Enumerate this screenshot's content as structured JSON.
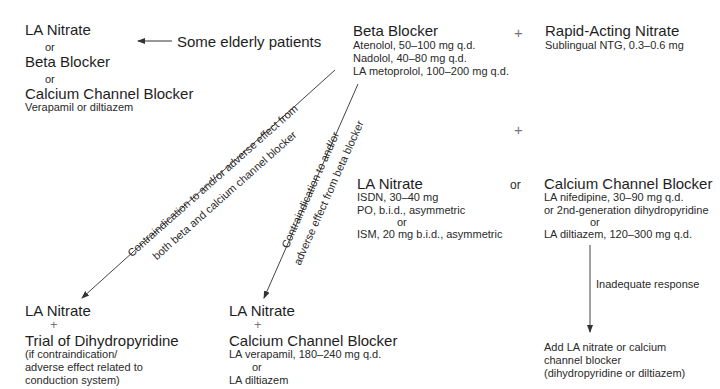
{
  "top_left": {
    "option1": "LA Nitrate",
    "or1": "or",
    "option2": "Beta Blocker",
    "or2": "or",
    "option3": "Calcium Channel Blocker",
    "option3_detail": "Verapamil or diltiazem"
  },
  "elderly_label": "Some elderly patients",
  "beta_blocker": {
    "title": "Beta Blocker",
    "doses": [
      "Atenolol, 50–100 mg q.d.",
      "Nadolol, 40–80 mg q.d.",
      "LA metoprolol, 100–200 mg q.d."
    ]
  },
  "plus_top": "+",
  "rapid_nitrate": {
    "title": "Rapid-Acting Nitrate",
    "detail": "Sublingual NTG, 0.3–0.6 mg"
  },
  "plus_mid": "+",
  "la_nitrate_mid": {
    "title": "LA Nitrate",
    "lines": [
      "ISDN, 30–40 mg",
      "PO, b.i.d., asymmetric",
      "or",
      "ISM, 20 mg b.i.d., asymmetric"
    ]
  },
  "or_mid": "or",
  "ccb_mid": {
    "title": "Calcium Channel Blocker",
    "lines": [
      "LA nifedipine, 30–90 mg q.d.",
      "or 2nd-generation dihydropyridine",
      "or",
      "LA diltiazem, 120–300 mg q.d."
    ]
  },
  "inadequate_label": "Inadequate response",
  "add_box": {
    "lines": [
      "Add LA nitrate or calcium",
      "channel blocker",
      "(dihydropyridine or diltiazem)"
    ]
  },
  "diag1": {
    "line1": "Contraindication to and/or adverse effect from",
    "line2": "both beta and calcium channel blocker"
  },
  "diag2": {
    "line1": "Contraindication to and/or",
    "line2": "adverse effect from beta blocker"
  },
  "bottom_left": {
    "title": "LA Nitrate",
    "plus": "+",
    "title2": "Trial of Dihydropyridine",
    "lines": [
      "(if contraindication/",
      "adverse effect related to",
      "conduction system)"
    ]
  },
  "bottom_mid": {
    "title": "LA Nitrate",
    "plus": "+",
    "title2": "Calcium Channel Blocker",
    "lines": [
      "LA verapamil, 180–240 mg q.d.",
      "or",
      "LA diltiazem"
    ]
  }
}
